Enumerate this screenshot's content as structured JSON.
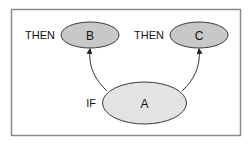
{
  "diagram": {
    "colors": {
      "frame": "#8a8a8a",
      "node_stroke": "#3a3a3a",
      "node_fill_dark": "#c8c8c8",
      "node_fill_light": "#e3e3e3",
      "edge": "#333333"
    },
    "nodes": [
      {
        "id": "A",
        "label": "A",
        "prefix": "IF"
      },
      {
        "id": "B",
        "label": "B",
        "prefix": "THEN"
      },
      {
        "id": "C",
        "label": "C",
        "prefix": "THEN"
      }
    ],
    "edges": [
      {
        "from": "A",
        "to": "B"
      },
      {
        "from": "A",
        "to": "C"
      }
    ]
  }
}
